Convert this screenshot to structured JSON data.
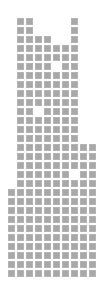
{
  "grid": {
    "origin_x": 9,
    "origin_y": 18,
    "pitch": 9,
    "cell_size": 7,
    "cell_color": "#a8a8a8",
    "background": "#ffffff",
    "rows": [
      [
        1,
        2,
        7
      ],
      [
        1,
        2,
        7
      ],
      [
        1,
        2,
        3,
        4,
        7
      ],
      [
        1,
        2,
        3,
        4,
        5,
        6,
        7
      ],
      [
        1,
        2,
        3,
        4,
        5,
        6,
        7
      ],
      [
        1,
        2,
        3,
        4,
        6,
        7
      ],
      [
        1,
        2,
        3,
        4,
        5,
        6,
        7
      ],
      [
        1,
        2,
        3,
        4,
        5,
        6,
        7
      ],
      [
        1,
        2,
        3,
        4,
        5,
        6,
        7
      ],
      [
        1,
        2,
        3,
        4,
        5,
        6,
        7
      ],
      [
        1,
        2,
        4,
        5,
        6,
        7
      ],
      [
        1,
        2,
        3,
        4,
        5,
        6,
        7
      ],
      [
        1,
        2,
        3,
        4,
        5,
        6,
        7
      ],
      [
        1,
        2,
        3,
        4,
        5,
        6,
        7
      ],
      [
        1,
        2,
        3,
        4,
        5,
        6,
        7,
        8,
        9
      ],
      [
        1,
        2,
        3,
        4,
        5,
        6,
        7,
        8,
        9
      ],
      [
        1,
        2,
        3,
        4,
        5,
        6,
        7,
        8,
        9
      ],
      [
        1,
        2,
        3,
        4,
        5,
        6,
        8,
        9
      ],
      [
        1,
        2,
        3,
        4,
        5,
        6,
        7,
        8,
        9
      ],
      [
        0,
        1,
        2,
        3,
        4,
        5,
        6,
        7,
        8,
        9
      ],
      [
        0,
        1,
        2,
        3,
        4,
        5,
        6,
        7,
        8,
        9
      ],
      [
        0,
        1,
        2,
        3,
        4,
        5,
        6,
        7,
        8,
        9
      ],
      [
        0,
        1,
        2,
        3,
        4,
        5,
        6,
        7,
        8,
        9
      ],
      [
        0,
        1,
        2,
        3,
        4,
        5,
        6,
        7,
        8,
        9
      ],
      [
        0,
        1,
        2,
        3,
        4,
        5,
        6,
        7,
        8,
        9
      ],
      [
        0,
        1,
        2,
        3,
        4,
        5,
        6,
        7,
        8,
        9
      ],
      [
        0,
        1,
        2,
        3,
        4,
        5,
        6,
        7,
        8,
        9
      ],
      [
        0,
        1,
        2,
        3,
        4,
        5,
        6,
        7,
        8,
        9
      ],
      [
        0,
        1,
        2,
        3,
        4,
        5,
        6,
        7,
        8,
        9
      ]
    ]
  }
}
